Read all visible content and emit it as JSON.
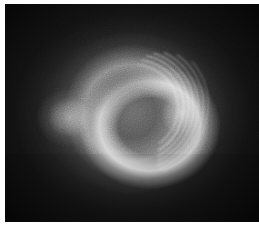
{
  "figure": {
    "width_px": 259,
    "height_px": 230,
    "orientation": "landscape"
  },
  "plate": {
    "label": "image-plate",
    "background_color": "#141414",
    "left_margin_px": 5,
    "top_margin_px": 4,
    "bottom_margin_px": 8,
    "right_margin_px": 0,
    "paper_color": "#ffffff"
  },
  "colorscale": {
    "type": "grayscale",
    "min_color": "#101010",
    "mid_color": "#7a7a7a",
    "max_color": "#f0f0f0",
    "background_level": "#181818",
    "peak_level": "#ebebeb"
  },
  "features": [
    {
      "name": "outer-halo",
      "kind": "diffuse-glow",
      "center_pct": [
        50.5,
        50.0
      ],
      "radius_px": [
        150,
        128
      ],
      "peak_gray": "#bebebe"
    },
    {
      "name": "main-ring",
      "kind": "annulus",
      "center_pct": [
        50.0,
        50.0
      ],
      "radius_px": 82,
      "peak_gray": "#cdcdcd"
    },
    {
      "name": "central-void",
      "kind": "dark-core",
      "center_pct": [
        52.0,
        41.5
      ],
      "radius_px": [
        46,
        40
      ],
      "peak_gray": "#0c0c0e"
    },
    {
      "name": "bright-crescent",
      "kind": "crescent",
      "center_pct": [
        57.0,
        56.0
      ],
      "position": "lower-right",
      "peak_gray": "#f8f8f8"
    },
    {
      "name": "left-lobe",
      "kind": "secondary-lobe",
      "center_pct": [
        25.5,
        52.0
      ],
      "radius_px": [
        34,
        30
      ],
      "peak_gray": "#e1e1e1"
    },
    {
      "name": "hot-knot",
      "kind": "peak-spot",
      "center_pct": [
        69.5,
        50.5
      ],
      "peak_gray": "#ffffff"
    }
  ],
  "fringes": {
    "name": "concentric-arc-fringes",
    "count": 7,
    "location": "right flank of crescent",
    "arcs": [
      {
        "rx": 46,
        "ry": 44,
        "rot": -18,
        "a0": -66,
        "a1": 70,
        "w": 1.5,
        "op": 0.4
      },
      {
        "rx": 52,
        "ry": 49,
        "rot": -18,
        "a0": -62,
        "a1": 76,
        "w": 1.6,
        "op": 0.5
      },
      {
        "rx": 57,
        "ry": 54,
        "rot": -18,
        "a0": -58,
        "a1": 80,
        "w": 1.7,
        "op": 0.46
      },
      {
        "rx": 62,
        "ry": 58,
        "rot": -18,
        "a0": -52,
        "a1": 82,
        "w": 1.8,
        "op": 0.4
      },
      {
        "rx": 67,
        "ry": 62,
        "rot": -18,
        "a0": -44,
        "a1": 84,
        "w": 1.9,
        "op": 0.32
      },
      {
        "rx": 72,
        "ry": 66,
        "rot": -18,
        "a0": -34,
        "a1": 84,
        "w": 2.0,
        "op": 0.24
      },
      {
        "rx": 77,
        "ry": 70,
        "rot": -18,
        "a0": -22,
        "a1": 82,
        "w": 2.0,
        "op": 0.16
      }
    ],
    "center_pct": [
      50.0,
      48.0
    ],
    "stroke_color": "#ffffff"
  },
  "grain": {
    "name": "sensor-noise",
    "enabled": true,
    "opacity": 0.5,
    "scale": 0.9
  },
  "vignette": {
    "name": "corner-vignette",
    "enabled": true,
    "strength": 0.68
  }
}
